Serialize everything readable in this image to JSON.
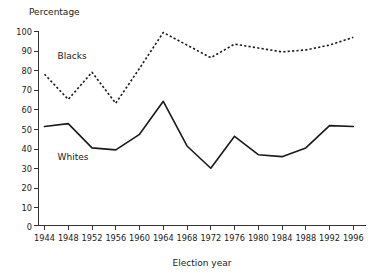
{
  "chart_data": {
    "type": "line",
    "title": "",
    "subtitle": "",
    "xlabel": "Election year",
    "ylabel": "Percentage",
    "ylabel_position": "top-left",
    "categories": [
      "1944",
      "1948",
      "1952",
      "1956",
      "1960",
      "1964",
      "1968",
      "1972",
      "1976",
      "1980",
      "1984",
      "1988",
      "1992",
      "1996"
    ],
    "x": [
      1944,
      1948,
      1952,
      1956,
      1960,
      1964,
      1968,
      1972,
      1976,
      1980,
      1984,
      1988,
      1992,
      1996
    ],
    "xlim": [
      1944,
      1996
    ],
    "ylim": [
      0,
      100
    ],
    "y_ticks": [
      0,
      10,
      20,
      30,
      40,
      50,
      60,
      70,
      80,
      90,
      100
    ],
    "y_tick_labels": [
      "0",
      "10",
      "20",
      "30",
      "40",
      "50",
      "60",
      "70",
      "80",
      "90",
      "100"
    ],
    "grid": false,
    "legend": "inline-annotations",
    "legend_position": "inside-plot",
    "series": [
      {
        "name": "Blacks",
        "style": "dotted",
        "color": "#1a1a1a",
        "label_x": 1946.2,
        "label_y": 86,
        "values": [
          78,
          65,
          79,
          63,
          81,
          99.5,
          93,
          86.5,
          93.5,
          91.5,
          89.5,
          90.5,
          93,
          97
        ]
      },
      {
        "name": "Whites",
        "style": "solid",
        "color": "#1a1a1a",
        "label_x": 1946.2,
        "label_y": 34,
        "values": [
          51,
          52.5,
          40,
          39,
          47,
          64,
          41,
          29.5,
          46,
          36.5,
          35.5,
          40,
          51.5,
          51
        ]
      }
    ]
  },
  "axes": {
    "y_axis_title": "Percentage",
    "x_axis_title": "Election year"
  }
}
